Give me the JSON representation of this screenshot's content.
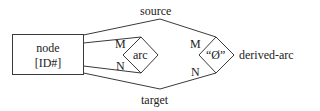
{
  "diagram": {
    "node": {
      "label_line1": "node",
      "label_line2": "[ID#]"
    },
    "arc": {
      "label": "arc",
      "cardinality_top": "M",
      "cardinality_bottom": "N"
    },
    "derived_arc": {
      "symbol": "“Ø”",
      "label": "derived-arc",
      "cardinality_top": "M",
      "cardinality_bottom": "N"
    },
    "relations": {
      "top": "source",
      "bottom": "target"
    },
    "colors": {
      "stroke": "#3a3a3a",
      "text": "#222222",
      "background": "#ffffff"
    }
  }
}
